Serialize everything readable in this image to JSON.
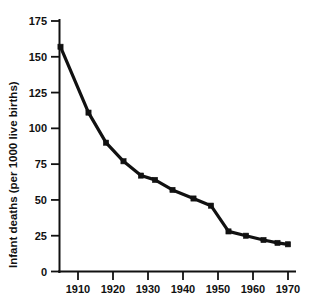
{
  "chart_data": {
    "type": "line",
    "title": "",
    "xlabel": "",
    "ylabel": "Infant deaths (per 1000 live births)",
    "xlim": [
      1905,
      1971
    ],
    "ylim": [
      0,
      175
    ],
    "grid": false,
    "legend": "none",
    "line_color": "#111111",
    "marker": "square",
    "x_ticks": [
      1910,
      1920,
      1930,
      1940,
      1950,
      1960,
      1970
    ],
    "x_tick_labels": [
      "1910",
      "1920",
      "1930",
      "1940",
      "1950",
      "1960",
      "1970"
    ],
    "y_ticks": [
      0,
      25,
      50,
      75,
      100,
      125,
      150,
      175
    ],
    "y_tick_labels": [
      "0",
      "25",
      "50",
      "75",
      "100",
      "125",
      "150",
      "175"
    ],
    "x": [
      1905,
      1913,
      1918,
      1923,
      1928,
      1932,
      1937,
      1943,
      1948,
      1953,
      1958,
      1963,
      1967,
      1970
    ],
    "values": [
      157,
      111,
      90,
      77,
      67,
      64,
      57,
      51,
      46,
      28,
      25,
      22,
      20,
      19
    ],
    "series": [
      {
        "name": "Infant deaths",
        "x": [
          1905,
          1913,
          1918,
          1923,
          1928,
          1932,
          1937,
          1943,
          1948,
          1953,
          1958,
          1963,
          1967,
          1970
        ],
        "values": [
          157,
          111,
          90,
          77,
          67,
          64,
          57,
          51,
          46,
          28,
          25,
          22,
          20,
          19
        ]
      }
    ]
  },
  "axes": {
    "y_title": "Infant deaths (per 1000 live births)"
  }
}
